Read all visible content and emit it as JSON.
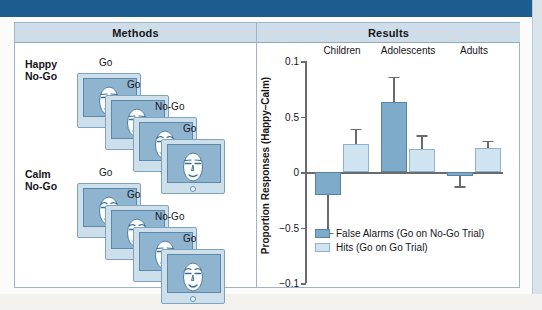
{
  "figure": {
    "panels": {
      "methods": {
        "title": "Methods"
      },
      "results": {
        "title": "Results"
      }
    }
  },
  "methods": {
    "conditions": [
      {
        "label": "Happy\nNo-Go",
        "face_type": "happy",
        "trials": [
          "Go",
          "Go",
          "No-Go",
          "Go"
        ]
      },
      {
        "label": "Calm\nNo-Go",
        "face_type": "calm",
        "trials": [
          "Go",
          "Go",
          "No-Go",
          "Go"
        ]
      }
    ]
  },
  "chart_data": {
    "type": "bar",
    "title": "Results",
    "xlabel": "",
    "ylabel": "Proportion Responses (Happy–Calm)",
    "categories": [
      "Children",
      "Adolescents",
      "Adults"
    ],
    "ytick_labels": [
      "0.1",
      "0.5",
      "0",
      "−0.5",
      "−0.1"
    ],
    "ytick_values": [
      1.0,
      0.5,
      0.0,
      -0.5,
      -1.0
    ],
    "ylim": [
      -1.0,
      1.0
    ],
    "grid": false,
    "zero_line": true,
    "legend_position": "inside-bottom-left",
    "series": [
      {
        "name": "False Alarms (Go on No-Go Trial)",
        "color": "#7fabca",
        "values": [
          -0.21,
          0.63,
          -0.04
        ],
        "errors": [
          0.34,
          0.23,
          0.09
        ]
      },
      {
        "name": "Hits (Go on Go Trial)",
        "color": "#cfe3f0",
        "values": [
          0.25,
          0.21,
          0.22
        ],
        "errors": [
          0.14,
          0.12,
          0.06
        ]
      }
    ]
  },
  "legend": {
    "items": [
      {
        "label": "False Alarms (Go on No-Go Trial)",
        "swatch": "fa"
      },
      {
        "label": "Hits (Go on Go Trial)",
        "swatch": "hit"
      }
    ]
  },
  "colors": {
    "top_strip": "#1c5c8e",
    "panel_header": "#cfdde8",
    "frame_border": "#9fb4c4",
    "bar_false_alarms": "#7fabca",
    "bar_hits": "#cfe3f0",
    "monitor_frame": "#cddfeb",
    "monitor_screen": "#8fb4cf",
    "axis": "#6b6b6b"
  }
}
